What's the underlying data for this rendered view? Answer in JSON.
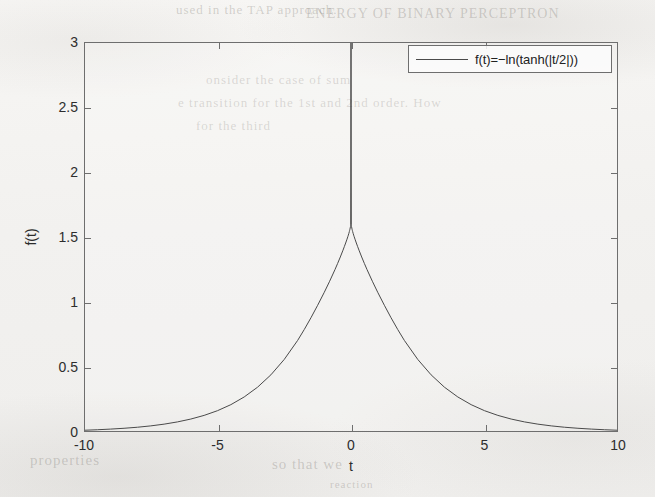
{
  "figure": {
    "background_color": "#f2f1ef",
    "line_color": "#4a4a4a",
    "axis_color": "#6e6e6e",
    "xlabel": "t",
    "ylabel": "f(t)",
    "legend": {
      "position": "top-right",
      "entries": [
        {
          "label": "f(t)=−ln(tanh(|t/2|))",
          "line_color": "#4a4a4a"
        }
      ]
    }
  },
  "ghost_text": [
    {
      "text": "used in the TAP approach.",
      "left": 176,
      "top": 2,
      "size": 13
    },
    {
      "text": "ENERGY OF BINARY PERCEPTRON",
      "left": 306,
      "top": 6,
      "size": 14
    },
    {
      "text": "onsider the case of sum",
      "left": 206,
      "top": 72,
      "size": 13
    },
    {
      "text": "e transition for the 1st and 2nd order.  How",
      "left": 178,
      "top": 95,
      "size": 13
    },
    {
      "text": "for the third",
      "left": 196,
      "top": 118,
      "size": 13
    },
    {
      "text": "properties",
      "left": 30,
      "top": 452,
      "size": 15
    },
    {
      "text": "so that we",
      "left": 272,
      "top": 456,
      "size": 15
    },
    {
      "text": "reaction",
      "left": 330,
      "top": 478,
      "size": 11
    }
  ],
  "chart_data": {
    "type": "line",
    "title": "",
    "xlabel": "t",
    "ylabel": "f(t)",
    "xlim": [
      -10,
      10
    ],
    "ylim": [
      0,
      3
    ],
    "xticks": [
      -10,
      -5,
      0,
      5,
      10
    ],
    "xticklabels": [
      "-10",
      "-5",
      "0",
      "5",
      "10"
    ],
    "yticks": [
      0,
      0.5,
      1,
      1.5,
      2,
      2.5,
      3
    ],
    "yticklabels": [
      "0",
      "0.5",
      "1",
      "1.5",
      "2",
      "2.5",
      "3"
    ],
    "grid": false,
    "legend_position": "upper right",
    "series": [
      {
        "name": "f(t)=−ln(tanh(|t/2|))",
        "formula": "-ln(tanh(|t/2|))",
        "color": "#4a4a4a",
        "linewidth": 1,
        "x": [
          -10,
          -9.5,
          -9,
          -8.5,
          -8,
          -7.5,
          -7,
          -6.5,
          -6,
          -5.5,
          -5,
          -4.5,
          -4,
          -3.5,
          -3,
          -2.5,
          -2,
          -1.75,
          -1.5,
          -1.25,
          -1,
          -0.8,
          -0.6,
          -0.5,
          -0.4,
          -0.3,
          -0.25,
          -0.2,
          -0.15,
          -0.12,
          -0.1,
          -0.08,
          -0.06,
          -0.05,
          -0.04,
          -0.03,
          -0.02,
          -0.015,
          -0.01,
          0,
          0.01,
          0.015,
          0.02,
          0.03,
          0.04,
          0.05,
          0.06,
          0.08,
          0.1,
          0.12,
          0.15,
          0.2,
          0.25,
          0.3,
          0.4,
          0.5,
          0.6,
          0.8,
          1,
          1.25,
          1.5,
          1.75,
          2,
          2.5,
          3,
          3.5,
          4,
          4.5,
          5,
          5.5,
          6,
          6.5,
          7,
          7.5,
          8,
          8.5,
          9,
          9.5,
          10
        ],
        "y": [
          0.0135,
          0.0174,
          0.0224,
          0.0287,
          0.0366,
          0.0471,
          0.0604,
          0.0776,
          0.0996,
          0.1278,
          0.164,
          0.2103,
          0.2695,
          0.3447,
          0.4397,
          0.5583,
          0.704,
          0.7884,
          0.8787,
          0.9745,
          1.075,
          1.1595,
          1.2494,
          1.2969,
          1.3464,
          1.3985,
          1.4257,
          1.4538,
          1.4832,
          1.5017,
          1.5146,
          1.5283,
          1.5432,
          1.5512,
          1.5598,
          1.5693,
          1.5802,
          1.5863,
          1.5932,
          3,
          1.5932,
          1.5863,
          1.5802,
          1.5693,
          1.5598,
          1.5512,
          1.5432,
          1.5283,
          1.5146,
          1.5017,
          1.4832,
          1.4538,
          1.4257,
          1.3985,
          1.3464,
          1.2969,
          1.2494,
          1.1595,
          1.075,
          0.9745,
          0.8787,
          0.7884,
          0.704,
          0.5583,
          0.4397,
          0.3447,
          0.2695,
          0.2103,
          0.164,
          0.1278,
          0.0996,
          0.0776,
          0.0604,
          0.0471,
          0.0366,
          0.0287,
          0.0224,
          0.0174,
          0.0135
        ]
      }
    ]
  }
}
